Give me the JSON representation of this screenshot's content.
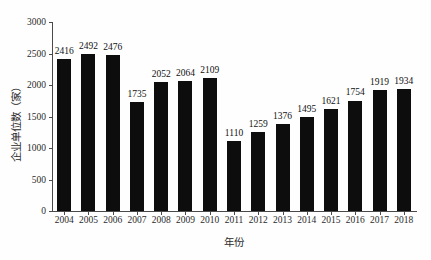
{
  "chart_data": {
    "type": "bar",
    "title": "",
    "subtitle": "",
    "xlabel": "年份",
    "ylabel": "企业单位数（家）",
    "categories": [
      "2004",
      "2005",
      "2006",
      "2007",
      "2008",
      "2009",
      "2010",
      "2011",
      "2012",
      "2013",
      "2014",
      "2015",
      "2016",
      "2017",
      "2018"
    ],
    "values": [
      2416,
      2492,
      2476,
      1735,
      2052,
      2064,
      2109,
      1110,
      1259,
      1376,
      1495,
      1621,
      1754,
      1919,
      1934
    ],
    "data_labels": [
      "2416",
      "2492",
      "2476",
      "1735",
      "2052",
      "2064",
      "2109",
      "1110",
      "1259",
      "1376",
      "1495",
      "1621",
      "1754",
      "1919",
      "1934"
    ],
    "ylim": [
      0,
      3000
    ],
    "ytick_values": [
      0,
      500,
      1000,
      1500,
      2000,
      2500,
      3000
    ],
    "ytick_labels": [
      "0",
      "500",
      "1000",
      "1500",
      "2000",
      "2500",
      "3000"
    ],
    "grid": false,
    "legend": null,
    "bar_color": "#0d0d0d",
    "axis_color": "#4a4a4a",
    "background_color": "#fefefe"
  }
}
